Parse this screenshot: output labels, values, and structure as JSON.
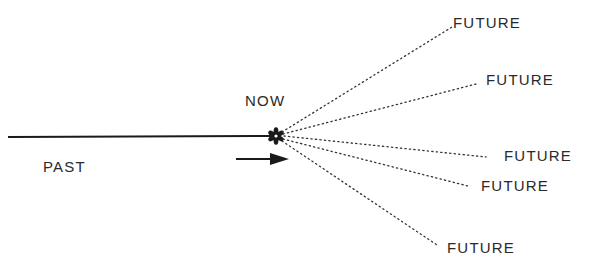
{
  "diagram": {
    "title": "",
    "labels": {
      "now": "NOW",
      "past": "PAST",
      "futures": [
        "FUTURE",
        "FUTURE",
        "FUTURE",
        "FUTURE",
        "FUTURE"
      ]
    },
    "colors": {
      "line": "#1a1a1a",
      "text": "#2a2a2a",
      "background": "#ffffff"
    },
    "elements": {
      "timeline": "solid line from past to now",
      "now_marker": "asterisk-icon",
      "direction_arrow": "arrow-right-icon",
      "future_paths": "5 dotted lines fanning out from now"
    }
  }
}
